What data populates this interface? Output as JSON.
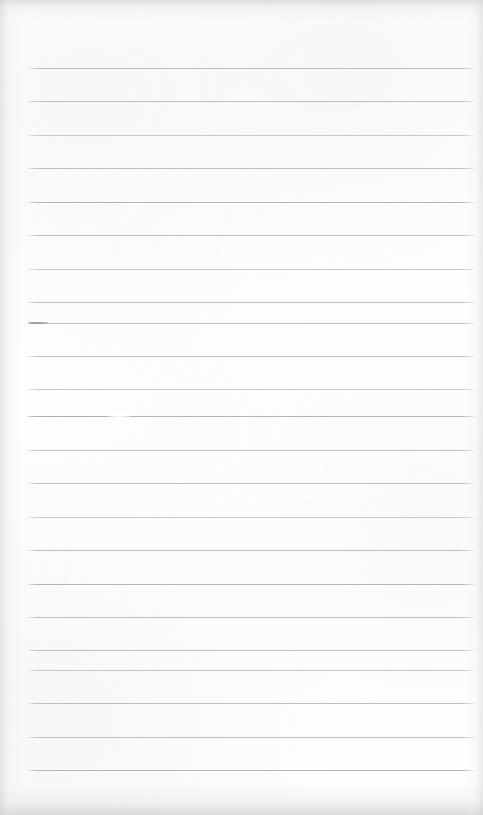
{
  "document": {
    "kind": "scanned-page",
    "description": "Blank ruled notepad page, scanned",
    "width_px": 483,
    "height_px": 815,
    "page_background_color": "#fefefe",
    "has_visible_text": false,
    "handwriting_present": false,
    "printed_text_present": false
  },
  "ruling": {
    "line_color": "#b9bdc1",
    "line_color_light": "#c5c9cd",
    "line_color_dark": "#b2b6bb",
    "line_thickness_px": 1,
    "line_left_px": 28,
    "line_right_px": 476,
    "line_width_px": 448,
    "line_spacing_px": 33.4,
    "first_line_y_px": 68,
    "last_line_y_px": 770,
    "line_count": 22,
    "margin_rule_present": false,
    "lines": [
      {
        "index": 1,
        "y": 68,
        "tone": "t-mid"
      },
      {
        "index": 2,
        "y": 101,
        "tone": "t-mid"
      },
      {
        "index": 3,
        "y": 135,
        "tone": "t-light"
      },
      {
        "index": 4,
        "y": 168,
        "tone": "t-mid"
      },
      {
        "index": 5,
        "y": 202,
        "tone": "t-dark"
      },
      {
        "index": 6,
        "y": 235,
        "tone": "t-mid"
      },
      {
        "index": 7,
        "y": 269,
        "tone": "t-light"
      },
      {
        "index": 8,
        "y": 302,
        "tone": "t-mid"
      },
      {
        "index": 9,
        "y": 323,
        "tone": "t-mid"
      },
      {
        "index": 10,
        "y": 356,
        "tone": "t-mid"
      },
      {
        "index": 11,
        "y": 389,
        "tone": "t-light"
      },
      {
        "index": 12,
        "y": 416,
        "tone": "t-dark"
      },
      {
        "index": 13,
        "y": 450,
        "tone": "t-mid"
      },
      {
        "index": 14,
        "y": 483,
        "tone": "t-mid"
      },
      {
        "index": 15,
        "y": 517,
        "tone": "t-light"
      },
      {
        "index": 16,
        "y": 550,
        "tone": "t-mid"
      },
      {
        "index": 17,
        "y": 584,
        "tone": "t-dark"
      },
      {
        "index": 18,
        "y": 617,
        "tone": "t-mid"
      },
      {
        "index": 19,
        "y": 650,
        "tone": "t-mid"
      },
      {
        "index": 20,
        "y": 670,
        "tone": "t-light"
      },
      {
        "index": 21,
        "y": 703,
        "tone": "t-mid"
      },
      {
        "index": 22,
        "y": 737,
        "tone": "t-mid"
      },
      {
        "index": 23,
        "y": 770,
        "tone": "t-dark"
      }
    ]
  },
  "artifacts": {
    "stub_mark": {
      "name": "dark-stub-left-end",
      "x": 28,
      "y": 322,
      "width": 22,
      "color": "#9aa0a6"
    },
    "emphasis_run": {
      "name": "heavier-ink-run",
      "x": 28,
      "y": 416,
      "width": 82,
      "color": "#a9aeb3"
    },
    "gap_mark": {
      "name": "faded-gap-in-rule",
      "x": 108,
      "y": 415,
      "width": 22,
      "color": "#fefefe"
    },
    "edge_shadows": {
      "top": true,
      "bottom": true,
      "left": true,
      "right": true,
      "shadow_color": "#c4c6c8"
    }
  },
  "margins": {
    "top_blank_px": 68,
    "bottom_blank_px": 45,
    "left_px": 28,
    "right_px": 7
  }
}
